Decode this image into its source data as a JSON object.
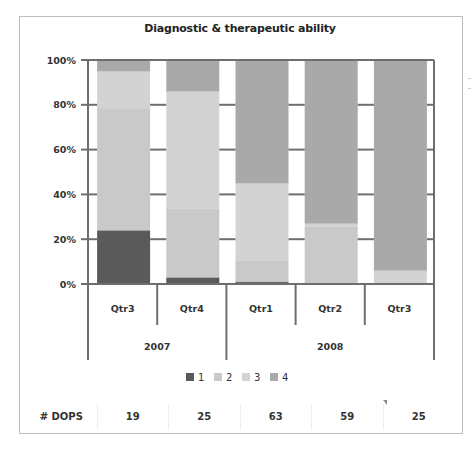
{
  "chart_data": {
    "type": "bar",
    "stacked": true,
    "percent": true,
    "title": "Diagnostic & therapeutic ability",
    "xlabel": "",
    "ylabel": "",
    "ylim": [
      0,
      100
    ],
    "yticks": [
      "0%",
      "20%",
      "40%",
      "60%",
      "80%",
      "100%"
    ],
    "categories": [
      "Qtr3",
      "Qtr4",
      "Qtr1",
      "Qtr2",
      "Qtr3"
    ],
    "groups": [
      {
        "label": "2007",
        "count": 2
      },
      {
        "label": "2008",
        "count": 3
      }
    ],
    "series": [
      {
        "name": "1",
        "color": "#5a5a5a",
        "values": [
          24,
          3,
          1,
          0,
          0
        ]
      },
      {
        "name": "2",
        "color": "#c9c9c9",
        "values": [
          54,
          30,
          9,
          25,
          0
        ]
      },
      {
        "name": "3",
        "color": "#d3d3d3",
        "values": [
          17,
          53,
          35,
          2,
          6
        ]
      },
      {
        "name": "4",
        "color": "#a9a9a9",
        "values": [
          5,
          14,
          55,
          73,
          94
        ]
      }
    ],
    "legend": {
      "placement": "bottom",
      "entries": [
        "1",
        "2",
        "3",
        "4"
      ]
    },
    "grid": false
  },
  "table": {
    "row_label": "# DOPS",
    "values": [
      "19",
      "25",
      "63",
      "59",
      "25"
    ]
  }
}
